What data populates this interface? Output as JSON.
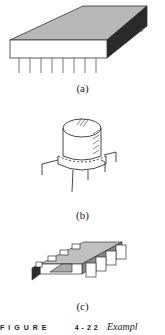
{
  "figure": {
    "panels": [
      {
        "id": "a",
        "label": "(a)",
        "description": "flat package with bottom pins"
      },
      {
        "id": "b",
        "label": "(b)",
        "description": "TO-5 metal can package with leads"
      },
      {
        "id": "c",
        "label": "(c)",
        "description": "flat-pack / surface-mount package with gull-wing tabs"
      }
    ],
    "caption": {
      "word": "FIGURE",
      "number": "4-22",
      "text": "Exampl"
    }
  },
  "colors": {
    "top_face": "#b8b8b8",
    "side_dark": "#2a2a2a",
    "outline": "#333333",
    "background": "#ffffff"
  }
}
